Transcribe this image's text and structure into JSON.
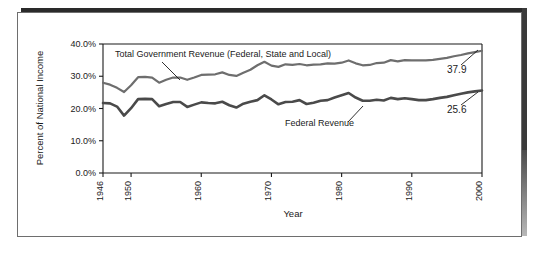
{
  "figure": {
    "frame_border_color": "#6e6e6e",
    "shadow_color": "#2a2a2a",
    "background": "#ffffff"
  },
  "chart_data": {
    "type": "line",
    "title": "",
    "xlabel": "Year",
    "ylabel": "Percent of National Income",
    "xlim": [
      1946,
      2000
    ],
    "ylim": [
      0,
      40
    ],
    "xticks": [
      1946,
      1950,
      1960,
      1970,
      1980,
      1990,
      2000
    ],
    "xtick_labels": [
      "1946",
      "1950",
      "1960",
      "1970",
      "1980",
      "1990",
      "2000"
    ],
    "yticks": [
      0,
      10,
      20,
      30,
      40
    ],
    "ytick_labels": [
      "0.0%",
      "10.0%",
      "20.0%",
      "30.0%",
      "40.0%"
    ],
    "grid": false,
    "legend_position": "inline-annotation",
    "x": [
      1946,
      1947,
      1948,
      1949,
      1950,
      1951,
      1952,
      1953,
      1954,
      1955,
      1956,
      1957,
      1958,
      1959,
      1960,
      1961,
      1962,
      1963,
      1964,
      1965,
      1966,
      1967,
      1968,
      1969,
      1970,
      1971,
      1972,
      1973,
      1974,
      1975,
      1976,
      1977,
      1978,
      1979,
      1980,
      1981,
      1982,
      1983,
      1984,
      1985,
      1986,
      1987,
      1988,
      1989,
      1990,
      1991,
      1992,
      1993,
      1994,
      1995,
      1996,
      1997,
      1998,
      1999,
      2000
    ],
    "series": [
      {
        "name": "Total Government Revenue (Federal, State and Local)",
        "color": "#6e6e6e",
        "line_width": 2.2,
        "end_label": "37.9",
        "values": [
          28.0,
          27.4,
          26.4,
          25.1,
          27.2,
          29.7,
          29.8,
          29.6,
          28.0,
          28.9,
          29.6,
          29.6,
          28.9,
          29.6,
          30.4,
          30.5,
          30.6,
          31.2,
          30.4,
          30.1,
          31.1,
          32.0,
          33.4,
          34.5,
          33.3,
          32.9,
          33.7,
          33.5,
          33.8,
          33.4,
          33.6,
          33.7,
          34.0,
          33.9,
          34.2,
          34.9,
          34.0,
          33.4,
          33.5,
          34.1,
          34.2,
          35.0,
          34.6,
          35.0,
          34.9,
          34.9,
          34.9,
          35.1,
          35.4,
          35.7,
          36.2,
          36.6,
          37.1,
          37.5,
          37.9
        ]
      },
      {
        "name": "Federal Revenue",
        "color": "#4a4a4a",
        "line_width": 2.6,
        "end_label": "25.6",
        "values": [
          21.7,
          21.6,
          20.6,
          17.8,
          20.1,
          22.9,
          23.0,
          22.9,
          20.7,
          21.4,
          22.0,
          22.0,
          20.5,
          21.2,
          21.9,
          21.7,
          21.6,
          22.1,
          21.0,
          20.3,
          21.5,
          22.1,
          22.6,
          24.1,
          22.8,
          21.3,
          22.0,
          22.1,
          22.6,
          21.4,
          21.8,
          22.4,
          22.6,
          23.4,
          24.1,
          24.8,
          23.4,
          22.4,
          22.4,
          22.7,
          22.5,
          23.3,
          22.9,
          23.2,
          22.9,
          22.6,
          22.6,
          22.9,
          23.3,
          23.6,
          24.1,
          24.6,
          25.0,
          25.3,
          25.6
        ]
      }
    ],
    "annotations": [
      {
        "text": "Total Government Revenue (Federal, State and Local)",
        "series": "Total Government Revenue (Federal, State and Local)"
      },
      {
        "text": "Federal Revenue",
        "series": "Federal Revenue"
      },
      {
        "text": "37.9",
        "series": "Total Government Revenue (Federal, State and Local)"
      },
      {
        "text": "25.6",
        "series": "Federal Revenue"
      }
    ]
  }
}
